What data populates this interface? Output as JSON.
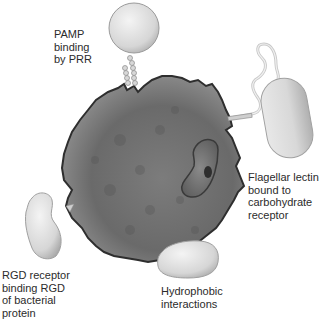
{
  "diagram": {
    "labels": {
      "pamp": "PAMP\nbinding\nby PRR",
      "flagellar": "Flagellar lectin\nbound to\ncarbohydrate\nreceptor",
      "rgd": "RGD receptor\nbinding RGD\nof bacterial\nprotein",
      "hydrophobic": "Hydrophobic\ninteractions"
    },
    "colors": {
      "phagocyte_dark": "#5a5a5a",
      "phagocyte_light": "#9a9a9a",
      "bacterium_light": "#e4e4e4",
      "bacterium_shade": "#b8b8b8",
      "text": "#2b2b2b"
    }
  }
}
